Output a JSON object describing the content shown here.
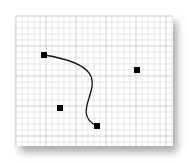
{
  "diagram": {
    "type": "bezier-curve-on-grid",
    "paper": {
      "x": 16,
      "y": 16,
      "width": 157,
      "height": 130,
      "grid_spacing": 6,
      "major_every": 5
    },
    "curve": {
      "start": [
        44,
        55
      ],
      "control1": [
        137,
        70
      ],
      "control2": [
        60,
        108
      ],
      "end": [
        97,
        126
      ]
    },
    "points": [
      {
        "name": "start-point",
        "x": 44,
        "y": 55
      },
      {
        "name": "control-point-1",
        "x": 137,
        "y": 70
      },
      {
        "name": "control-point-2",
        "x": 60,
        "y": 108
      },
      {
        "name": "end-point",
        "x": 97,
        "y": 126
      }
    ],
    "colors": {
      "grid_minor": "#d8d8d8",
      "grid_major": "#b0b0b0",
      "curve": "#111111",
      "point": "#000000"
    }
  }
}
